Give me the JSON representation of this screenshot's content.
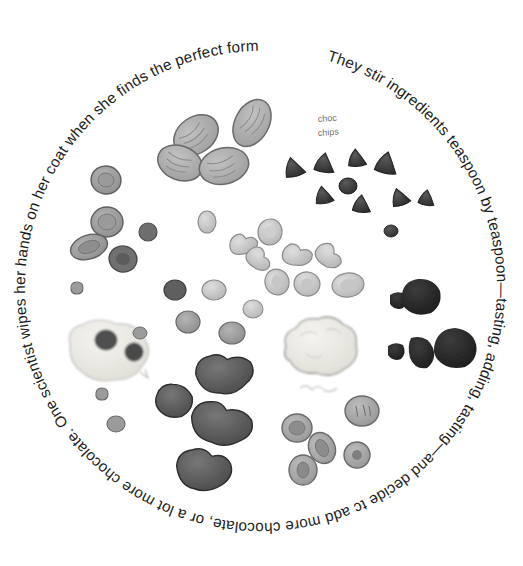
{
  "illustration": {
    "title": "Chocolate chip cookie ingredients arranged in a circle",
    "background_color": "#ffffff",
    "ink_color": "#1d1d1d",
    "circle": {
      "center_x": 261,
      "center_y": 287,
      "text_radius": 236
    },
    "ring_text": "They stir ingredients teaspoon by teaspoon—tasting, adding, tasting—and decide tc add more chocolate, or a lot more chocolate. One scientist wipes her hands on her coat when she finds the perfect formula.",
    "handwritten_labels": [
      {
        "name": "choc-chips-label",
        "line1": "choc",
        "line2": "chips",
        "x": 318,
        "y": 122,
        "color": "#7a7a7a"
      },
      {
        "name": "faint-label",
        "line1": "——",
        "line2": "",
        "x": 306,
        "y": 392,
        "color": "#b5b5b5"
      }
    ],
    "ingredient_groups": [
      {
        "name": "nuts",
        "color_fill": "#a8a8a8",
        "color_stroke": "#6a6a6a",
        "items": [
          {
            "cx": 196,
            "cy": 135,
            "rx": 24,
            "ry": 18,
            "rot": -35
          },
          {
            "cx": 180,
            "cy": 163,
            "rx": 23,
            "ry": 17,
            "rot": 20
          },
          {
            "cx": 222,
            "cy": 165,
            "rx": 25,
            "ry": 18,
            "rot": -15
          },
          {
            "cx": 252,
            "cy": 123,
            "rx": 17,
            "ry": 25,
            "rot": 28
          }
        ]
      },
      {
        "name": "oat-flakes-left",
        "color_fill": "#9b9b9b",
        "color_stroke": "#5f5f5f",
        "items": [
          {
            "cx": 106,
            "cy": 180,
            "rx": 15,
            "ry": 14,
            "rot": 10
          },
          {
            "cx": 107,
            "cy": 222,
            "rx": 16,
            "ry": 15,
            "rot": 0
          },
          {
            "cx": 89,
            "cy": 247,
            "rx": 19,
            "ry": 12,
            "rot": -18
          },
          {
            "cx": 123,
            "cy": 259,
            "rx": 14,
            "ry": 13,
            "rot": 15
          },
          {
            "cx": 148,
            "cy": 232,
            "rx": 9,
            "ry": 9,
            "rot": 0
          }
        ]
      },
      {
        "name": "choc-chips",
        "color_fill": "#3d3d3d",
        "color_stroke": "#2a2a2a",
        "items": [
          {
            "cx": 294,
            "cy": 167,
            "r": 10
          },
          {
            "cx": 325,
            "cy": 163,
            "r": 10
          },
          {
            "cx": 357,
            "cy": 158,
            "r": 9
          },
          {
            "cx": 387,
            "cy": 163,
            "r": 11
          },
          {
            "cx": 324,
            "cy": 195,
            "r": 9
          },
          {
            "cx": 348,
            "cy": 186,
            "r": 8
          },
          {
            "cx": 362,
            "cy": 204,
            "r": 9
          },
          {
            "cx": 400,
            "cy": 197,
            "r": 9
          },
          {
            "cx": 427,
            "cy": 198,
            "r": 8
          },
          {
            "cx": 391,
            "cy": 230,
            "r": 7
          }
        ]
      },
      {
        "name": "pale-cereal-center",
        "color_fill": "#c9c9c9",
        "color_stroke": "#8c8c8c",
        "items": [
          {
            "cx": 207,
            "cy": 222,
            "rx": 9,
            "ry": 11,
            "rot": 0
          },
          {
            "cx": 243,
            "cy": 243,
            "rx": 14,
            "ry": 12,
            "rot": -20
          },
          {
            "cx": 259,
            "cy": 257,
            "rx": 13,
            "ry": 12,
            "rot": 25
          },
          {
            "cx": 270,
            "cy": 232,
            "rx": 12,
            "ry": 13,
            "rot": 10
          },
          {
            "cx": 297,
            "cy": 254,
            "rx": 15,
            "ry": 12,
            "rot": -10
          },
          {
            "cx": 329,
            "cy": 255,
            "rx": 14,
            "ry": 13,
            "rot": 20
          },
          {
            "cx": 214,
            "cy": 290,
            "rx": 12,
            "ry": 10,
            "rot": 0
          },
          {
            "cx": 277,
            "cy": 282,
            "rx": 12,
            "ry": 13,
            "rot": -15
          },
          {
            "cx": 307,
            "cy": 284,
            "rx": 13,
            "ry": 12,
            "rot": 12
          },
          {
            "cx": 348,
            "cy": 285,
            "rx": 16,
            "ry": 12,
            "rot": -8
          },
          {
            "cx": 253,
            "cy": 309,
            "rx": 10,
            "ry": 9,
            "rot": 0
          },
          {
            "cx": 188,
            "cy": 322,
            "rx": 12,
            "ry": 11,
            "rot": 0
          },
          {
            "cx": 232,
            "cy": 333,
            "rx": 13,
            "ry": 11,
            "rot": 0
          },
          {
            "cx": 175,
            "cy": 290,
            "rx": 11,
            "ry": 10,
            "rot": 0
          }
        ]
      },
      {
        "name": "cream-blob-left",
        "color_fill": "#e8e6e0",
        "color_stroke": "#b9b9b9",
        "cx": 110,
        "cy": 350
      },
      {
        "name": "cream-blob-center",
        "color_fill": "#f0efea",
        "color_stroke": "#9f9f9f",
        "cx": 320,
        "cy": 347
      },
      {
        "name": "dark-chunks-right",
        "color_fill": "#2e2e2e",
        "color_stroke": "#1a1a1a",
        "items": [
          {
            "cx": 399,
            "cy": 300,
            "r": 9
          },
          {
            "cx": 420,
            "cy": 297,
            "r": 19
          },
          {
            "cx": 397,
            "cy": 351,
            "r": 9
          },
          {
            "cx": 425,
            "cy": 352,
            "r": 16
          },
          {
            "cx": 455,
            "cy": 349,
            "r": 21
          }
        ]
      },
      {
        "name": "dark-chunks-bottom",
        "color_fill": "#5a5a5a",
        "color_stroke": "#333333",
        "items": [
          {
            "cx": 225,
            "cy": 374,
            "rx": 29,
            "ry": 21,
            "rot": -8
          },
          {
            "cx": 175,
            "cy": 402,
            "rx": 19,
            "ry": 17,
            "rot": 10
          },
          {
            "cx": 222,
            "cy": 424,
            "rx": 31,
            "ry": 22,
            "rot": 6
          },
          {
            "cx": 204,
            "cy": 470,
            "rx": 27,
            "ry": 22,
            "rot": -4
          }
        ]
      },
      {
        "name": "round-pieces-bottom-right",
        "color_fill": "#a5a5a5",
        "color_stroke": "#6a6a6a",
        "items": [
          {
            "cx": 297,
            "cy": 428,
            "rx": 15,
            "ry": 14,
            "rot": 0
          },
          {
            "cx": 322,
            "cy": 448,
            "rx": 13,
            "ry": 16,
            "rot": -25
          },
          {
            "cx": 362,
            "cy": 411,
            "rx": 17,
            "ry": 15,
            "rot": 0
          },
          {
            "cx": 357,
            "cy": 455,
            "rx": 13,
            "ry": 13,
            "rot": 0
          },
          {
            "cx": 303,
            "cy": 470,
            "rx": 14,
            "ry": 15,
            "rot": 0
          }
        ]
      },
      {
        "name": "small-specks",
        "color_fill": "#8f8f8f",
        "color_stroke": "#5f5f5f",
        "items": [
          {
            "cx": 79,
            "cy": 288,
            "r": 8
          },
          {
            "cx": 104,
            "cy": 394,
            "r": 8
          },
          {
            "cx": 116,
            "cy": 424,
            "r": 9
          },
          {
            "cx": 140,
            "cy": 333,
            "r": 7
          },
          {
            "cx": 392,
            "cy": 231,
            "r": 6
          }
        ]
      }
    ]
  }
}
